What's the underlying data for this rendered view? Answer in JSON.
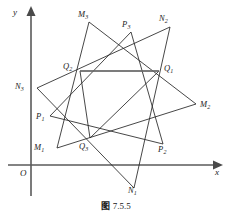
{
  "figure": {
    "caption_cjk": "图",
    "caption_number": "7.5.5",
    "axes": {
      "x_label": "x",
      "y_label": "y",
      "origin_label": "O"
    },
    "colors": {
      "axis": "#5a5a5a",
      "polygon": "#262626",
      "chord": "#6f6f6f",
      "background": "#ffffff",
      "text": "#1c1c1c"
    },
    "points": [
      {
        "id": "M1",
        "base": "M",
        "sub": "1",
        "x": 57,
        "y": 148,
        "lx": 34,
        "ly": 143
      },
      {
        "id": "M2",
        "base": "M",
        "sub": "2",
        "x": 196,
        "y": 104,
        "lx": 200,
        "ly": 100
      },
      {
        "id": "M3",
        "base": "M",
        "sub": "3",
        "x": 89,
        "y": 22,
        "lx": 78,
        "ly": 10
      },
      {
        "id": "N1",
        "base": "N",
        "sub": "1",
        "x": 134,
        "y": 188,
        "lx": 128,
        "ly": 186
      },
      {
        "id": "N2",
        "base": "N",
        "sub": "2",
        "x": 170,
        "y": 27,
        "lx": 159,
        "ly": 14
      },
      {
        "id": "N3",
        "base": "N",
        "sub": "3",
        "x": 37,
        "y": 88,
        "lx": 15,
        "ly": 82
      },
      {
        "id": "P1",
        "base": "P",
        "sub": "1",
        "x": 50,
        "y": 116,
        "lx": 36,
        "ly": 112
      },
      {
        "id": "P2",
        "base": "P",
        "sub": "2",
        "x": 163,
        "y": 144,
        "lx": 158,
        "ly": 145
      },
      {
        "id": "P3",
        "base": "P",
        "sub": "3",
        "x": 131,
        "y": 32,
        "lx": 122,
        "ly": 20
      },
      {
        "id": "Q1",
        "base": "Q",
        "sub": "1",
        "x": 159,
        "y": 71,
        "lx": 164,
        "ly": 64
      },
      {
        "id": "Q2",
        "base": "Q",
        "sub": "2",
        "x": 80,
        "y": 71,
        "lx": 63,
        "ly": 62
      },
      {
        "id": "Q3",
        "base": "Q",
        "sub": "3",
        "x": 90,
        "y": 138,
        "lx": 79,
        "ly": 142
      }
    ],
    "triangles": [
      {
        "name": "triangle-M",
        "vertices": [
          "M1",
          "M2",
          "M3"
        ]
      },
      {
        "name": "triangle-N",
        "vertices": [
          "N1",
          "N2",
          "N3"
        ]
      },
      {
        "name": "triangle-P",
        "vertices": [
          "P1",
          "P2",
          "P3"
        ]
      },
      {
        "name": "triangle-Q",
        "vertices": [
          "Q1",
          "Q2",
          "Q3"
        ]
      }
    ],
    "chords": [
      {
        "name": "chord-q2-q1",
        "from": "Q2",
        "to": "Q1"
      }
    ]
  }
}
